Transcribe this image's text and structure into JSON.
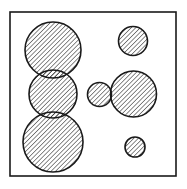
{
  "diagram": {
    "type": "circle-arrangement",
    "background": "#ffffff",
    "stroke_color": "#1a1a1a",
    "hatch_color": "#2a2a2a",
    "frame": {
      "x": 10,
      "y": 12,
      "width": 166,
      "height": 164
    },
    "circles": [
      {
        "id": "left-top",
        "cx": 53,
        "cy": 50,
        "r": 28
      },
      {
        "id": "left-middle",
        "cx": 53,
        "cy": 94,
        "r": 24
      },
      {
        "id": "left-bottom",
        "cx": 53,
        "cy": 142,
        "r": 30
      },
      {
        "id": "right-top",
        "cx": 133,
        "cy": 41,
        "r": 14.5
      },
      {
        "id": "center-small",
        "cx": 99.5,
        "cy": 94.5,
        "r": 12
      },
      {
        "id": "right-middle",
        "cx": 133.5,
        "cy": 94,
        "r": 23
      },
      {
        "id": "right-bottom",
        "cx": 135,
        "cy": 147,
        "r": 10
      }
    ]
  }
}
